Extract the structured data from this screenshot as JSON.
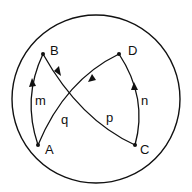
{
  "diagram": {
    "type": "directed graph inside circle",
    "nodes": [
      {
        "id": "A",
        "label": "A",
        "x": 38,
        "y": 145
      },
      {
        "id": "B",
        "label": "B",
        "x": 43,
        "y": 54
      },
      {
        "id": "C",
        "label": "C",
        "x": 135,
        "y": 145
      },
      {
        "id": "D",
        "label": "D",
        "x": 119,
        "y": 54
      }
    ],
    "edges": [
      {
        "id": "m",
        "label": "m",
        "from": "A",
        "to": "B"
      },
      {
        "id": "p",
        "label": "p",
        "from": "B",
        "to": "C"
      },
      {
        "id": "n",
        "label": "n",
        "from": "C",
        "to": "D"
      },
      {
        "id": "q",
        "label": "q",
        "from": "D",
        "to": "A"
      }
    ]
  }
}
